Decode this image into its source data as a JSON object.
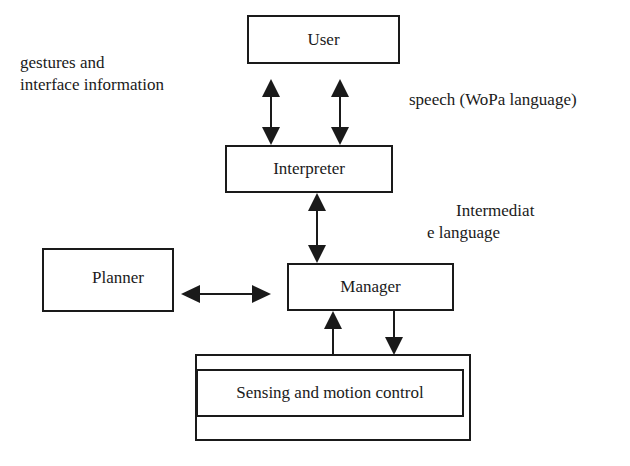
{
  "diagram": {
    "nodes": {
      "user": {
        "label": "User"
      },
      "interpreter": {
        "label": "Interpreter"
      },
      "manager": {
        "label": "Manager"
      },
      "planner": {
        "label": "Planner"
      },
      "sensing": {
        "label": "Sensing and motion control"
      }
    },
    "annotations": {
      "gestures_line1": "gestures and",
      "gestures_line2": "interface information",
      "speech": "speech (WoPa language)",
      "intermediate_line1": "Intermediat",
      "intermediate_line2": "e language"
    },
    "edges": [
      {
        "from": "user",
        "to": "interpreter",
        "type": "bidirectional",
        "meaning": "gestures and interface information"
      },
      {
        "from": "user",
        "to": "interpreter",
        "type": "bidirectional",
        "meaning": "speech (WoPa language)"
      },
      {
        "from": "interpreter",
        "to": "manager",
        "type": "bidirectional",
        "meaning": "Intermediate language"
      },
      {
        "from": "planner",
        "to": "manager",
        "type": "bidirectional"
      },
      {
        "from": "sensing",
        "to": "manager",
        "type": "directed"
      },
      {
        "from": "manager",
        "to": "sensing",
        "type": "directed"
      }
    ],
    "colors": {
      "stroke": "#1a1a1a",
      "background": "#ffffff"
    }
  }
}
